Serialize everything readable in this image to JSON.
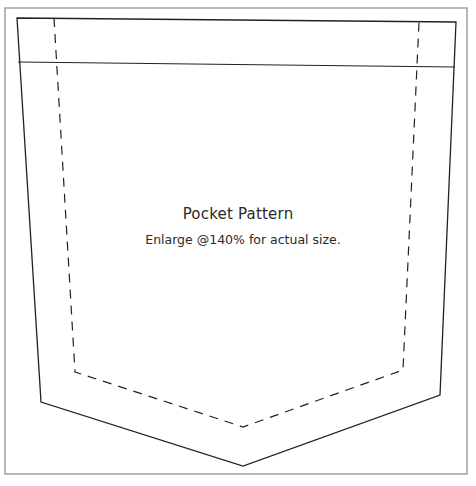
{
  "diagram": {
    "title": "Pocket Pattern",
    "subtitle": "Enlarge @140% for actual size.",
    "colors": {
      "frame": "#a0a0a0",
      "cut_line": "#222222",
      "stitch_line": "#222222",
      "text": "#2a2a2a"
    },
    "shapes": {
      "frame": "5,8 467,8 467,474 5,474",
      "pocket_outline": "17,18 456,22 440,395 243,466 41,402",
      "band_line": "18,62 455,67",
      "stitch_line": "54,18 75,372 243,427 403,370 419,22"
    }
  }
}
